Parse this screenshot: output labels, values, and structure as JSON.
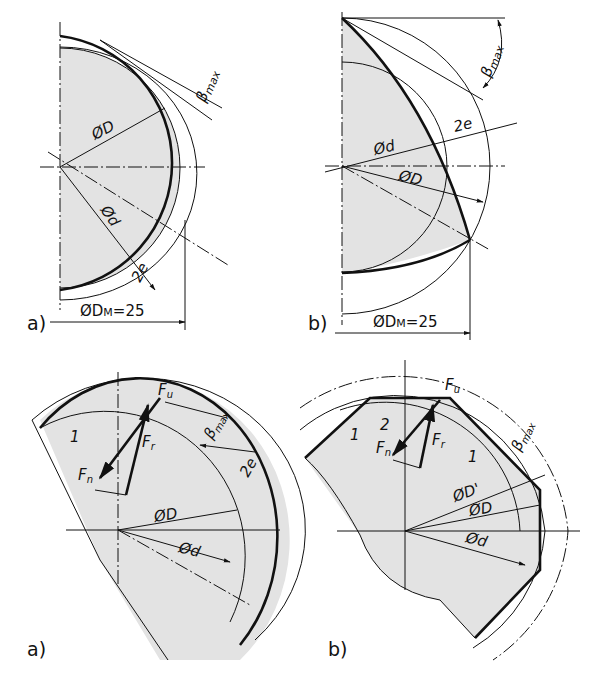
{
  "figure": {
    "panels": [
      {
        "id": "top-a",
        "label": "a)",
        "annotations": {
          "D": "ØD",
          "d": "Ød",
          "beta": "β",
          "beta_sub": "max",
          "e": "2e",
          "DM": "ØD",
          "DM_sub": "M",
          "DM_val": "=25"
        }
      },
      {
        "id": "top-b",
        "label": "b)",
        "annotations": {
          "D": "ØD",
          "d": "Ød",
          "beta": "β",
          "beta_sub": "max",
          "e": "2e",
          "DM": "ØD",
          "DM_sub": "M",
          "DM_val": "=25"
        }
      },
      {
        "id": "bottom-a",
        "label": "a)",
        "annotations": {
          "Fu": "F",
          "Fu_sub": "u",
          "Fr": "F",
          "Fr_sub": "r",
          "Fn": "F",
          "Fn_sub": "n",
          "beta": "β",
          "beta_sub": "max",
          "e": "2e",
          "D": "ØD",
          "d": "Ød",
          "one": "1"
        }
      },
      {
        "id": "bottom-b",
        "label": "b)",
        "annotations": {
          "Fu": "F",
          "Fu_sub": "u",
          "Fr": "F",
          "Fr_sub": "r",
          "Fn": "F",
          "Fn_sub": "n",
          "beta": "β",
          "beta_sub": "max",
          "Dp": "ØD'",
          "D": "ØD",
          "d": "Ød",
          "one": "1",
          "two": "2"
        }
      }
    ]
  }
}
